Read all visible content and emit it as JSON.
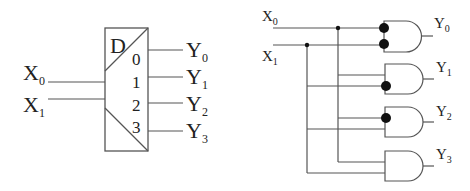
{
  "symbol": {
    "title": "D",
    "inputs": [
      {
        "name": "X",
        "sub": "0"
      },
      {
        "name": "X",
        "sub": "1"
      }
    ],
    "pins": [
      "0",
      "1",
      "2",
      "3"
    ],
    "outputs": [
      {
        "name": "Y",
        "sub": "0"
      },
      {
        "name": "Y",
        "sub": "1"
      },
      {
        "name": "Y",
        "sub": "2"
      },
      {
        "name": "Y",
        "sub": "3"
      }
    ]
  },
  "circuit": {
    "inputs": [
      {
        "name": "X",
        "sub": "0"
      },
      {
        "name": "X",
        "sub": "1"
      }
    ],
    "gates": [
      {
        "type": "AND",
        "inverted_inputs": [
          "X0",
          "X1"
        ],
        "output": {
          "name": "Y",
          "sub": "0"
        }
      },
      {
        "type": "AND",
        "inverted_inputs": [
          "X1"
        ],
        "output": {
          "name": "Y",
          "sub": "1"
        }
      },
      {
        "type": "AND",
        "inverted_inputs": [
          "X0"
        ],
        "output": {
          "name": "Y",
          "sub": "2"
        }
      },
      {
        "type": "AND",
        "inverted_inputs": [],
        "output": {
          "name": "Y",
          "sub": "3"
        }
      }
    ]
  },
  "colors": {
    "line": "#555555",
    "text": "#222222",
    "bubble": "#111111"
  }
}
